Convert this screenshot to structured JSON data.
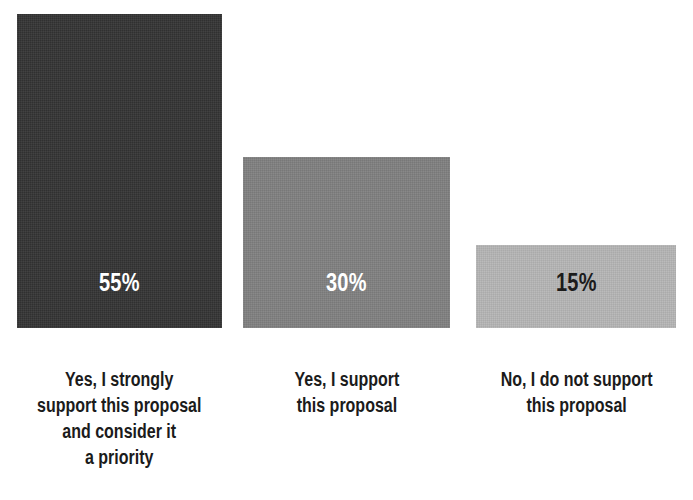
{
  "chart_data": {
    "type": "bar",
    "title": "",
    "subtitle": "",
    "xlabel": "",
    "ylabel": "",
    "grid": false,
    "legend": "none",
    "ylim": [
      0,
      55
    ],
    "categories": [
      "Yes, I strongly\nsupport this proposal\nand consider it\na priority",
      "Yes, I support\nthis proposal",
      "No, I do not support\nthis proposal"
    ],
    "values": [
      55,
      30,
      15
    ],
    "value_labels": [
      "55%",
      "30%",
      "15%"
    ],
    "series": [
      {
        "name": "Share of respondents",
        "values": [
          55,
          30,
          15
        ]
      }
    ],
    "bar_colors": [
      "#333333",
      "#808080",
      "#b5b5b5"
    ],
    "value_label_colors": [
      "#ffffff",
      "#ffffff",
      "#1b1b1b"
    ],
    "background_color": "#ffffff",
    "label_color": "#1b1b1b"
  },
  "bars": [
    {
      "id": "bar-strongly-support",
      "value_label": "55%",
      "value": 55,
      "color": "#333333",
      "value_color": "#ffffff",
      "label": "Yes, I strongly\nsupport this proposal\nand consider it\na priority",
      "left": 17,
      "width": 205,
      "height": 314,
      "label_left": 8,
      "label_width": 223
    },
    {
      "id": "bar-support",
      "value_label": "30%",
      "value": 30,
      "color": "#808080",
      "value_color": "#ffffff",
      "label": "Yes, I support\nthis proposal",
      "left": 243,
      "width": 207,
      "height": 171,
      "label_left": 238,
      "label_width": 217
    },
    {
      "id": "bar-not-support",
      "value_label": "15%",
      "value": 15,
      "color": "#b5b5b5",
      "value_color": "#1b1b1b",
      "label": "No, I do not support\nthis proposal",
      "left": 476,
      "width": 200,
      "height": 83,
      "label_left": 466,
      "label_width": 221
    }
  ]
}
